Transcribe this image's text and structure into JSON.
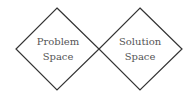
{
  "diagram": {
    "shapes": [
      {
        "id": "problem-space",
        "type": "diamond",
        "line1": "Problem",
        "line2": "Space"
      },
      {
        "id": "solution-space",
        "type": "diamond",
        "line1": "Solution",
        "line2": "Space"
      }
    ],
    "colors": {
      "stroke": "#333333",
      "text": "#555555",
      "background": "#ffffff"
    }
  }
}
